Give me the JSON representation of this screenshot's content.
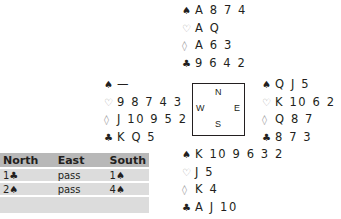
{
  "hands": {
    "north": [
      {
        "suit": "♠",
        "color": "black",
        "cards": "A 8 7 4"
      },
      {
        "suit": "♡",
        "color": "red",
        "cards": "A Q"
      },
      {
        "suit": "◊",
        "color": "red",
        "cards": "A 6 3"
      },
      {
        "suit": "♣",
        "color": "black",
        "cards": "9 6 4 2"
      }
    ],
    "west": [
      {
        "suit": "♠",
        "color": "black",
        "cards": "—"
      },
      {
        "suit": "♡",
        "color": "red",
        "cards": "9 8 7 4 3"
      },
      {
        "suit": "◊",
        "color": "red",
        "cards": "J 10 9 5 2"
      },
      {
        "suit": "♣",
        "color": "black",
        "cards": "K Q 5"
      }
    ],
    "east": [
      {
        "suit": "♠",
        "color": "black",
        "cards": "Q J 5"
      },
      {
        "suit": "♡",
        "color": "red",
        "cards": "K 10 6 2"
      },
      {
        "suit": "◊",
        "color": "red",
        "cards": "Q 8 7"
      },
      {
        "suit": "♣",
        "color": "black",
        "cards": "8 7 3"
      }
    ],
    "south": [
      {
        "suit": "♠",
        "color": "black",
        "cards": "K 10 9 6 3 2"
      },
      {
        "suit": "♡",
        "color": "red",
        "cards": "J 5"
      },
      {
        "suit": "◊",
        "color": "red",
        "cards": "K 4"
      },
      {
        "suit": "♣",
        "color": "black",
        "cards": "A J 10"
      }
    ]
  },
  "compass": {
    "n": "N",
    "e": "E",
    "s": "S",
    "w": "W"
  },
  "bidding": {
    "headers": [
      "North",
      "East",
      "South"
    ],
    "rows": [
      [
        "1♣",
        "pass",
        "1♠"
      ],
      [
        "2♠",
        "pass",
        "4♠"
      ],
      [
        "",
        "",
        ""
      ]
    ]
  },
  "colors": {
    "black": "#231f20",
    "red_suit": "#9a9a9a",
    "header_bg": "#b8b8b8",
    "row_bg": "#dcdcdc"
  }
}
